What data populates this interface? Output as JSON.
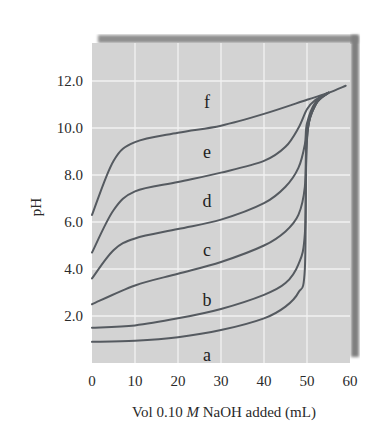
{
  "chart_data": {
    "type": "line",
    "title": "",
    "xlabel": "Vol 0.10 M NaOH added (mL)",
    "xlabel_parts": {
      "before": "Vol 0.10 ",
      "italic": "M",
      "after": " NaOH added (mL)"
    },
    "ylabel": "pH",
    "xlim": [
      0,
      60
    ],
    "ylim": [
      0,
      13.5
    ],
    "xticks": [
      0,
      10,
      20,
      30,
      40,
      50,
      60
    ],
    "xtick_labels": [
      "0",
      "10",
      "20",
      "30",
      "40",
      "50",
      "60"
    ],
    "yticks": [
      2,
      4,
      6,
      8,
      10,
      12
    ],
    "ytick_labels": [
      "2.0",
      "4.0",
      "6.0",
      "8.0",
      "10.0",
      "12.0"
    ],
    "grid": true,
    "legend": "inline labels",
    "series": [
      {
        "name": "a",
        "label_at": [
          30,
          0.35
        ],
        "x": [
          0,
          10,
          20,
          30,
          40,
          45,
          48,
          49.5,
          50,
          52,
          55
        ],
        "y": [
          0.9,
          0.95,
          1.1,
          1.4,
          1.9,
          2.4,
          3.0,
          4.0,
          9.5,
          11.0,
          11.5
        ]
      },
      {
        "name": "b",
        "label_at": [
          30,
          2.7
        ],
        "x": [
          0,
          10,
          20,
          30,
          40,
          45,
          48,
          49.5,
          50,
          52,
          55
        ],
        "y": [
          1.5,
          1.6,
          1.9,
          2.3,
          2.9,
          3.4,
          4.2,
          5.5,
          9.6,
          11.0,
          11.5
        ]
      },
      {
        "name": "c",
        "label_at": [
          30,
          4.8
        ],
        "x": [
          0,
          10,
          20,
          30,
          40,
          45,
          48,
          49.5,
          50,
          52,
          55
        ],
        "y": [
          2.5,
          3.3,
          3.8,
          4.3,
          5.0,
          5.6,
          6.3,
          7.5,
          9.8,
          11.0,
          11.5
        ]
      },
      {
        "name": "d",
        "label_at": [
          30,
          6.9
        ],
        "x": [
          0,
          5,
          10,
          20,
          30,
          40,
          45,
          48,
          49.5,
          50,
          52,
          55
        ],
        "y": [
          3.6,
          4.8,
          5.3,
          5.7,
          6.1,
          6.8,
          7.5,
          8.3,
          9.3,
          10.2,
          11.1,
          11.5
        ]
      },
      {
        "name": "e",
        "label_at": [
          30,
          9.0
        ],
        "x": [
          0,
          5,
          10,
          20,
          30,
          40,
          45,
          48,
          50,
          52,
          55
        ],
        "y": [
          4.7,
          6.5,
          7.3,
          7.7,
          8.1,
          8.6,
          9.2,
          10.0,
          10.8,
          11.2,
          11.5
        ]
      },
      {
        "name": "f",
        "label_at": [
          30,
          11.1
        ],
        "x": [
          0,
          5,
          10,
          20,
          30,
          40,
          50,
          55,
          59
        ],
        "y": [
          6.3,
          8.6,
          9.4,
          9.8,
          10.1,
          10.6,
          11.2,
          11.5,
          11.8
        ]
      }
    ]
  },
  "colors": {
    "plot_bg": "#d4d4d4",
    "grid": "#f2f2f2",
    "curve": "#555a60",
    "shadow": "#8a8a8a",
    "text": "#2a2a2a"
  }
}
